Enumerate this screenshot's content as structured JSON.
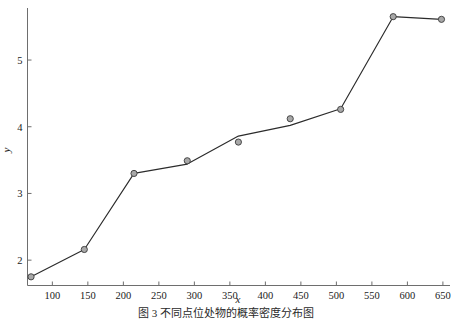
{
  "caption": {
    "text": "图 3 不同点位处物的概率密度分布图"
  },
  "chart_data": {
    "type": "line",
    "title": "",
    "subtitle": "",
    "xlabel": "x",
    "ylabel": "y",
    "xlim": [
      65,
      660
    ],
    "ylim": [
      1.62,
      5.78
    ],
    "grid": false,
    "legend": null,
    "xticks": [
      100,
      150,
      200,
      250,
      300,
      350,
      400,
      450,
      500,
      550,
      600,
      650
    ],
    "xtick_labels": [
      "100",
      "150",
      "200",
      "250",
      "300",
      "350",
      "400",
      "450",
      "500",
      "550",
      "600",
      "650"
    ],
    "yticks": [
      2,
      3,
      4,
      5
    ],
    "ytick_labels": [
      "2",
      "3",
      "4",
      "5"
    ],
    "series": [
      {
        "name": "fitted-line",
        "style": "line",
        "x": [
          70,
          145,
          215,
          290,
          362,
          435,
          506,
          580,
          648
        ],
        "y": [
          1.75,
          2.16,
          3.3,
          3.44,
          3.86,
          4.02,
          4.27,
          5.65,
          5.61
        ]
      },
      {
        "name": "observed-points",
        "style": "markers",
        "marker": "circle",
        "x": [
          70,
          145,
          215,
          290,
          362,
          435,
          506,
          580,
          648
        ],
        "y": [
          1.75,
          2.16,
          3.3,
          3.49,
          3.77,
          4.12,
          4.26,
          5.65,
          5.61
        ]
      }
    ],
    "colors": {
      "line": "#2b2b2b",
      "marker_fill": "#a8a8a8",
      "marker_edge": "#3a3a3a",
      "axis": "#6e6e6e",
      "text": "#1a1a1a",
      "background": "#ffffff"
    }
  }
}
